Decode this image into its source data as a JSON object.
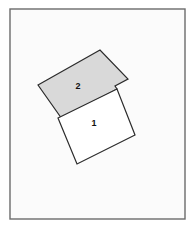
{
  "figure": {
    "canvas": {
      "width": 196,
      "height": 230,
      "background": "#ffffff"
    },
    "frame": {
      "name": "diagram-border",
      "x": 10,
      "y": 9,
      "width": 175,
      "height": 210,
      "fill": "#fbfbfb",
      "stroke": "#6b6b6b",
      "stroke_width": 1.4
    },
    "shapes": [
      {
        "id": "region-2",
        "label": "2",
        "fill": "#d9d9d9",
        "stroke": "#2b2b2b",
        "stroke_width": 1.2,
        "points": "38,85 100,50 128,79 115,86 117,89 62,119",
        "label_x": 78,
        "label_y": 87
      },
      {
        "id": "region-1",
        "label": "1",
        "fill": "#ffffff",
        "stroke": "#2b2b2b",
        "stroke_width": 1.2,
        "points": "58,118 117,89 135,135 77,164",
        "label_x": 94,
        "label_y": 124
      }
    ],
    "labels": [
      {
        "name": "region-label-2",
        "text": "2"
      },
      {
        "name": "region-label-1",
        "text": "1"
      }
    ]
  }
}
